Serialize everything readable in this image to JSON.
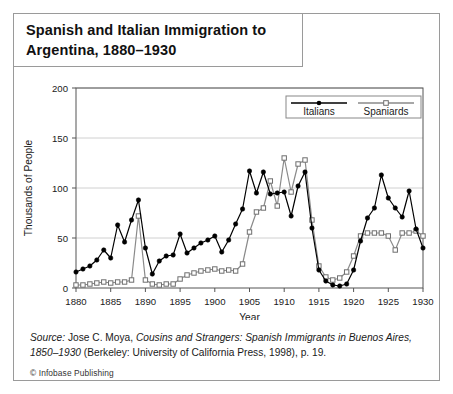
{
  "title": {
    "line1": "Spanish and Italian Immigration to",
    "line2": "Argentina, 1880–1930"
  },
  "source": {
    "prefix": "Source:",
    "text_part1": " Jose C. Moya, ",
    "work_italic": "Cousins and Strangers: Spanish Immigrants in Buenos Aires,",
    "work_italic2": "1850–1930",
    "text_part2": " (Berkeley: University of California Press, 1998), p. 19.",
    "copyright_mark": "©",
    "copyright_text": "Infobase Publishing"
  },
  "chart_data": {
    "type": "line",
    "title": "Spanish and Italian Immigration to Argentina, 1880–1930",
    "xlabel": "Year",
    "ylabel": "Thousands of People",
    "xlim": [
      1880,
      1930
    ],
    "ylim": [
      0,
      200
    ],
    "yticks": [
      0,
      50,
      100,
      150,
      200
    ],
    "ytick_labels": [
      "0",
      "50",
      "100",
      "150",
      "200"
    ],
    "xticks": [
      1880,
      1885,
      1890,
      1895,
      1900,
      1905,
      1910,
      1915,
      1920,
      1925,
      1930
    ],
    "xtick_labels": [
      "1880",
      "1885",
      "1890",
      "1895",
      "1900",
      "1905",
      "1910",
      "1915",
      "1920",
      "1925",
      "1930"
    ],
    "grid": "horizontal",
    "legend_position": "top-right",
    "x": [
      1880,
      1881,
      1882,
      1883,
      1884,
      1885,
      1886,
      1887,
      1888,
      1889,
      1890,
      1891,
      1892,
      1893,
      1894,
      1895,
      1896,
      1897,
      1898,
      1899,
      1900,
      1901,
      1902,
      1903,
      1904,
      1905,
      1906,
      1907,
      1908,
      1909,
      1910,
      1911,
      1912,
      1913,
      1914,
      1915,
      1916,
      1917,
      1918,
      1919,
      1920,
      1921,
      1922,
      1923,
      1924,
      1925,
      1926,
      1927,
      1928,
      1929,
      1930
    ],
    "series": [
      {
        "name": "Italians",
        "marker": "filled-circle",
        "color": "#000000",
        "values": [
          16,
          19,
          22,
          28,
          38,
          30,
          63,
          46,
          68,
          88,
          40,
          14,
          27,
          32,
          33,
          54,
          35,
          40,
          45,
          48,
          52,
          36,
          48,
          64,
          79,
          117,
          95,
          116,
          94,
          95,
          96,
          72,
          102,
          116,
          60,
          18,
          7,
          3,
          2,
          4,
          18,
          47,
          70,
          80,
          113,
          90,
          80,
          71,
          97,
          59,
          40
        ]
      },
      {
        "name": "Spaniards",
        "marker": "open-circle",
        "color": "#8a8a8a",
        "values": [
          3,
          3,
          4,
          5,
          6,
          5,
          6,
          6,
          8,
          72,
          8,
          4,
          3,
          4,
          4,
          9,
          13,
          15,
          17,
          18,
          19,
          17,
          18,
          17,
          24,
          56,
          76,
          80,
          107,
          82,
          130,
          96,
          124,
          128,
          68,
          22,
          11,
          8,
          10,
          16,
          32,
          52,
          55,
          55,
          55,
          52,
          38,
          55,
          55,
          57,
          52
        ]
      }
    ],
    "legend": [
      {
        "label": "Italians",
        "marker": "filled-circle"
      },
      {
        "label": "Spaniards",
        "marker": "open-circle"
      }
    ]
  }
}
